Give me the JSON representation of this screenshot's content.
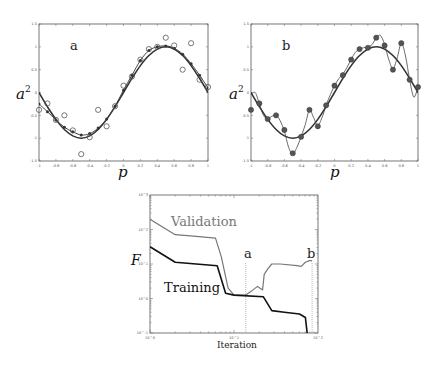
{
  "chart_data": [
    {
      "type": "scatter",
      "panel_label": "a",
      "xlabel": "p",
      "ylabel": "a",
      "ylabel_sup": "2",
      "xlim": [
        -1,
        1
      ],
      "ylim": [
        -1.5,
        1.5
      ],
      "xticks": [
        "-1",
        "-0.8",
        "-0.6",
        "-0.4",
        "-0.2",
        "0",
        "0.2",
        "0.4",
        "0.6",
        "0.8",
        "1"
      ],
      "yticks": [
        "1.5",
        "1",
        "0.5",
        "0",
        "-0.5",
        "-1",
        "-1.5"
      ],
      "series": [
        {
          "name": "target function",
          "style": "smooth line",
          "x": [
            -1,
            -0.9,
            -0.8,
            -0.7,
            -0.6,
            -0.5,
            -0.4,
            -0.3,
            -0.2,
            -0.1,
            0,
            0.1,
            0.2,
            0.3,
            0.4,
            0.5,
            0.6,
            0.7,
            0.8,
            0.9,
            1
          ],
          "y": [
            0,
            -0.31,
            -0.59,
            -0.81,
            -0.95,
            -1.0,
            -0.95,
            -0.81,
            -0.59,
            -0.31,
            0,
            0.31,
            0.59,
            0.81,
            0.95,
            1.0,
            0.95,
            0.81,
            0.59,
            0.31,
            0
          ]
        },
        {
          "name": "network response (good generalization)",
          "style": "line with dots",
          "x": [
            -1,
            -0.9,
            -0.8,
            -0.7,
            -0.6,
            -0.5,
            -0.4,
            -0.3,
            -0.2,
            -0.1,
            0,
            0.1,
            0.2,
            0.3,
            0.4,
            0.5,
            0.6,
            0.7,
            0.8,
            0.9,
            1
          ],
          "y": [
            -0.25,
            -0.42,
            -0.6,
            -0.76,
            -0.86,
            -0.93,
            -0.9,
            -0.78,
            -0.58,
            -0.3,
            0.05,
            0.38,
            0.7,
            0.92,
            1.0,
            1.02,
            0.97,
            0.84,
            0.63,
            0.38,
            0.1
          ]
        },
        {
          "name": "noisy training targets",
          "style": "open circles",
          "x": [
            -1,
            -0.9,
            -0.8,
            -0.7,
            -0.6,
            -0.5,
            -0.4,
            -0.3,
            -0.2,
            -0.1,
            0,
            0.1,
            0.2,
            0.3,
            0.4,
            0.5,
            0.6,
            0.7,
            0.8,
            0.9,
            1
          ],
          "y": [
            -0.38,
            -0.24,
            -0.6,
            -0.5,
            -0.83,
            -1.35,
            -0.98,
            -0.38,
            -0.74,
            -0.3,
            0.15,
            0.35,
            0.72,
            0.95,
            1.0,
            1.2,
            1.03,
            0.5,
            1.08,
            0.28,
            0.12
          ]
        }
      ]
    },
    {
      "type": "scatter",
      "panel_label": "b",
      "xlabel": "p",
      "ylabel": "a",
      "ylabel_sup": "2",
      "xlim": [
        -1,
        1
      ],
      "ylim": [
        -1.5,
        1.5
      ],
      "xticks": [
        "-1",
        "-0.8",
        "-0.6",
        "-0.4",
        "-0.2",
        "0",
        "0.2",
        "0.4",
        "0.6",
        "0.8",
        "1"
      ],
      "yticks": [
        "1.5",
        "1",
        "0.5",
        "0",
        "-0.5",
        "-1",
        "-1.5"
      ],
      "series": [
        {
          "name": "target function",
          "style": "smooth line",
          "x": [
            -1,
            -0.9,
            -0.8,
            -0.7,
            -0.6,
            -0.5,
            -0.4,
            -0.3,
            -0.2,
            -0.1,
            0,
            0.1,
            0.2,
            0.3,
            0.4,
            0.5,
            0.6,
            0.7,
            0.8,
            0.9,
            1
          ],
          "y": [
            0,
            -0.31,
            -0.59,
            -0.81,
            -0.95,
            -1.0,
            -0.95,
            -0.81,
            -0.59,
            -0.31,
            0,
            0.31,
            0.59,
            0.81,
            0.95,
            1.0,
            0.95,
            0.81,
            0.59,
            0.31,
            0
          ]
        },
        {
          "name": "network response (overfit)",
          "style": "thin wiggly line",
          "x": [
            -1,
            -0.95,
            -0.9,
            -0.85,
            -0.8,
            -0.75,
            -0.7,
            -0.65,
            -0.6,
            -0.55,
            -0.5,
            -0.45,
            -0.4,
            -0.35,
            -0.3,
            -0.25,
            -0.2,
            -0.15,
            -0.1,
            -0.05,
            0,
            0.05,
            0.1,
            0.15,
            0.2,
            0.25,
            0.3,
            0.35,
            0.4,
            0.45,
            0.5,
            0.55,
            0.6,
            0.65,
            0.7,
            0.75,
            0.8,
            0.85,
            0.9,
            0.95,
            1
          ],
          "y": [
            -0.05,
            0.0,
            -0.25,
            -0.5,
            -0.58,
            -0.52,
            -0.5,
            -0.62,
            -0.85,
            -1.2,
            -1.35,
            -1.2,
            -0.97,
            -0.7,
            -0.38,
            -0.55,
            -0.72,
            -0.55,
            -0.28,
            -0.05,
            0.15,
            0.3,
            0.4,
            0.55,
            0.73,
            0.88,
            0.95,
            0.98,
            1.0,
            1.05,
            1.2,
            1.25,
            1.05,
            0.72,
            0.52,
            0.75,
            1.08,
            0.8,
            0.28,
            -0.1,
            0.12
          ]
        },
        {
          "name": "noisy training targets",
          "style": "filled dots",
          "x": [
            -1,
            -0.9,
            -0.8,
            -0.7,
            -0.6,
            -0.5,
            -0.4,
            -0.3,
            -0.2,
            -0.1,
            0,
            0.1,
            0.2,
            0.3,
            0.4,
            0.5,
            0.6,
            0.7,
            0.8,
            0.9,
            1
          ],
          "y": [
            -0.38,
            -0.24,
            -0.58,
            -0.5,
            -0.82,
            -1.33,
            -0.97,
            -0.38,
            -0.74,
            -0.28,
            0.15,
            0.38,
            0.72,
            0.95,
            0.98,
            1.2,
            1.03,
            0.5,
            1.08,
            0.28,
            0.12
          ]
        }
      ]
    },
    {
      "type": "line",
      "xlabel": "Iteration",
      "ylabel": "F",
      "xscale": "log",
      "yscale": "log",
      "xlim_exp": [
        0,
        2
      ],
      "ylim_exp": [
        -1,
        3
      ],
      "xticks": [
        "10^0",
        "10^1",
        "10^2"
      ],
      "yticks": [
        "10^3",
        "10^2",
        "10^1",
        "10^0",
        "10^-1"
      ],
      "annotations": [
        {
          "text": "a",
          "x_exp": 1.14,
          "note": "dotted vertical line at validation minimum"
        },
        {
          "text": "b",
          "x_exp": 1.93,
          "note": "dotted vertical line near end of training"
        }
      ],
      "series": [
        {
          "name": "Validation",
          "color": "#777777",
          "x_exp": [
            0,
            0.3,
            0.55,
            0.78,
            0.85,
            0.93,
            1.0,
            1.14,
            1.2,
            1.28,
            1.34,
            1.36,
            1.4,
            1.45,
            1.55,
            1.75,
            1.8,
            1.85,
            1.9,
            1.93
          ],
          "y_exp": [
            2.3,
            1.85,
            1.8,
            1.75,
            1.2,
            0.3,
            0.1,
            0.1,
            0.2,
            0.35,
            0.25,
            0.7,
            0.85,
            1.0,
            1.0,
            0.95,
            0.93,
            1.05,
            1.1,
            1.1
          ]
        },
        {
          "name": "Training",
          "color": "#111111",
          "x_exp": [
            0,
            0.3,
            0.55,
            0.8,
            0.9,
            1.0,
            1.35,
            1.45,
            1.6,
            1.78,
            1.85,
            1.88,
            1.9
          ],
          "y_exp": [
            1.5,
            1.05,
            1.0,
            0.95,
            0.15,
            0.1,
            0.05,
            -0.35,
            -0.4,
            -0.45,
            -0.55,
            -1.2,
            -1.6
          ]
        }
      ]
    }
  ]
}
